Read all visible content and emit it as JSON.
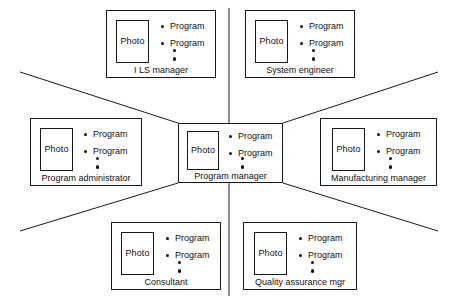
{
  "diagram": {
    "type": "radial-org-chart",
    "line_color": "#1a1a1a",
    "text_color": "#111111",
    "background": "#ffffff",
    "photo_label": "Photo",
    "program_label_1": "Program",
    "program_label_2": "Program",
    "ellipsis_dot_count": 2
  },
  "cards": {
    "center": {
      "id": "program-manager",
      "title": "Program manager",
      "photo": "Photo",
      "programs": [
        "Program",
        "Program"
      ]
    },
    "top_left": {
      "id": "ils-manager",
      "title": "I LS manager",
      "photo": "Photo",
      "programs": [
        "Program",
        "Program"
      ]
    },
    "top_right": {
      "id": "system-engineer",
      "title": "System engineer",
      "photo": "Photo",
      "programs": [
        "Program",
        "Program"
      ]
    },
    "mid_left": {
      "id": "program-administrator",
      "title": "Program administrator",
      "photo": "Photo",
      "programs": [
        "Program",
        "Program"
      ]
    },
    "mid_right": {
      "id": "manufacturing-manager",
      "title": "Manufacturing manager",
      "photo": "Photo",
      "programs": [
        "Program",
        "Program"
      ]
    },
    "bottom_left": {
      "id": "consultant",
      "title": "Consultant",
      "photo": "Photo",
      "programs": [
        "Program",
        "Program"
      ]
    },
    "bottom_right": {
      "id": "quality-assurance-mgr",
      "title": "Quality assurance mgr",
      "photo": "Photo",
      "programs": [
        "Program",
        "Program"
      ]
    }
  }
}
